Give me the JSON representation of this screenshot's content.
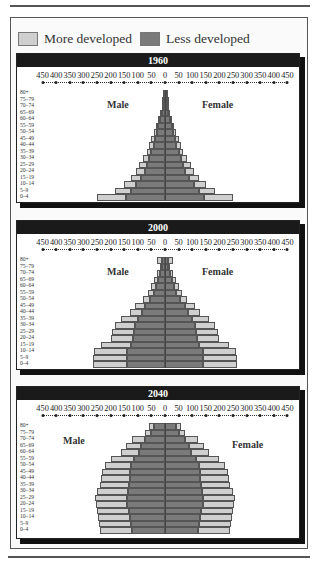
{
  "legend": {
    "items": [
      {
        "label": "More developed",
        "color": "#cfcfcf"
      },
      {
        "label": "Less developed",
        "color": "#7a7a7a"
      }
    ]
  },
  "labels": {
    "male": "Male",
    "female": "Female"
  },
  "axis": {
    "ticks": [
      "450",
      "400",
      "350",
      "300",
      "250",
      "200",
      "150",
      "100",
      "50",
      "0",
      "50",
      "100",
      "150",
      "200",
      "250",
      "300",
      "350",
      "400",
      "450"
    ]
  },
  "age_groups": [
    "80+",
    "75–79",
    "70–74",
    "65–69",
    "60–64",
    "55–59",
    "50–54",
    "45–49",
    "40–44",
    "35–39",
    "30–34",
    "25–29",
    "20–24",
    "15–19",
    "10–14",
    "5–9",
    "0–4"
  ],
  "chart_data": [
    {
      "type": "bar",
      "subtype": "population-pyramid",
      "title": "1960",
      "xlabel": "",
      "ylabel": "",
      "xlim": [
        -450,
        450
      ],
      "categories": [
        "80+",
        "75-79",
        "70-74",
        "65-69",
        "60-64",
        "55-59",
        "50-54",
        "45-49",
        "40-44",
        "35-39",
        "30-34",
        "25-29",
        "20-24",
        "15-19",
        "10-14",
        "5-9",
        "0-4"
      ],
      "legend": [
        "More developed",
        "Less developed"
      ],
      "series": [
        {
          "name": "Male total (More + Less developed)",
          "values": [
            8,
            10,
            12,
            18,
            25,
            32,
            40,
            50,
            58,
            68,
            80,
            95,
            105,
            125,
            150,
            185,
            250
          ]
        },
        {
          "name": "Male Less developed",
          "values": [
            5,
            6,
            8,
            12,
            18,
            25,
            30,
            36,
            42,
            50,
            58,
            65,
            75,
            88,
            105,
            125,
            145
          ]
        },
        {
          "name": "Female total (More + Less developed)",
          "values": [
            8,
            10,
            12,
            18,
            25,
            32,
            40,
            50,
            58,
            68,
            80,
            95,
            105,
            125,
            150,
            185,
            250
          ]
        },
        {
          "name": "Female Less developed",
          "values": [
            5,
            6,
            8,
            12,
            18,
            25,
            30,
            36,
            42,
            50,
            58,
            65,
            75,
            88,
            105,
            125,
            145
          ]
        }
      ]
    },
    {
      "type": "bar",
      "subtype": "population-pyramid",
      "title": "2000",
      "xlabel": "",
      "ylabel": "",
      "xlim": [
        -450,
        450
      ],
      "categories": [
        "80+",
        "75-79",
        "70-74",
        "65-69",
        "60-64",
        "55-59",
        "50-54",
        "45-49",
        "40-44",
        "35-39",
        "30-34",
        "25-29",
        "20-24",
        "15-19",
        "10-14",
        "5-9",
        "0-4"
      ],
      "legend": [
        "More developed",
        "Less developed"
      ],
      "series": [
        {
          "name": "Male total (More + Less developed)",
          "values": [
            30,
            18,
            28,
            40,
            50,
            62,
            80,
            110,
            130,
            160,
            185,
            195,
            200,
            235,
            260,
            265,
            265
          ]
        },
        {
          "name": "Male Less developed",
          "values": [
            12,
            12,
            18,
            25,
            32,
            40,
            55,
            72,
            85,
            100,
            110,
            115,
            118,
            125,
            140,
            138,
            138
          ]
        },
        {
          "name": "Female total (More + Less developed)",
          "values": [
            30,
            18,
            28,
            40,
            50,
            62,
            80,
            110,
            130,
            160,
            185,
            195,
            200,
            235,
            260,
            265,
            265
          ]
        },
        {
          "name": "Female Less developed",
          "values": [
            12,
            12,
            18,
            25,
            32,
            40,
            55,
            72,
            85,
            100,
            110,
            115,
            118,
            125,
            140,
            138,
            138
          ]
        }
      ]
    },
    {
      "type": "bar",
      "subtype": "population-pyramid",
      "title": "2040",
      "xlabel": "",
      "ylabel": "",
      "xlim": [
        -450,
        450
      ],
      "categories": [
        "80+",
        "75-79",
        "70-74",
        "65-69",
        "60-64",
        "55-59",
        "50-54",
        "45-49",
        "40-44",
        "35-39",
        "30-34",
        "25-29",
        "20-24",
        "15-19",
        "10-14",
        "5-9",
        "0-4"
      ],
      "legend": [
        "More developed",
        "Less developed"
      ],
      "series": [
        {
          "name": "Male total (More + Less developed)",
          "values": [
            60,
            75,
            120,
            145,
            160,
            200,
            220,
            230,
            235,
            240,
            250,
            258,
            255,
            250,
            245,
            242,
            240
          ]
        },
        {
          "name": "Male Less developed",
          "values": [
            42,
            50,
            72,
            88,
            95,
            115,
            125,
            128,
            130,
            132,
            135,
            140,
            138,
            132,
            128,
            125,
            122
          ]
        },
        {
          "name": "Female total (More + Less developed)",
          "values": [
            60,
            75,
            120,
            145,
            160,
            200,
            220,
            230,
            235,
            240,
            250,
            258,
            255,
            250,
            245,
            242,
            240
          ]
        },
        {
          "name": "Female Less developed",
          "values": [
            42,
            50,
            72,
            88,
            95,
            115,
            125,
            128,
            130,
            132,
            135,
            140,
            138,
            132,
            128,
            125,
            122
          ]
        }
      ]
    }
  ]
}
